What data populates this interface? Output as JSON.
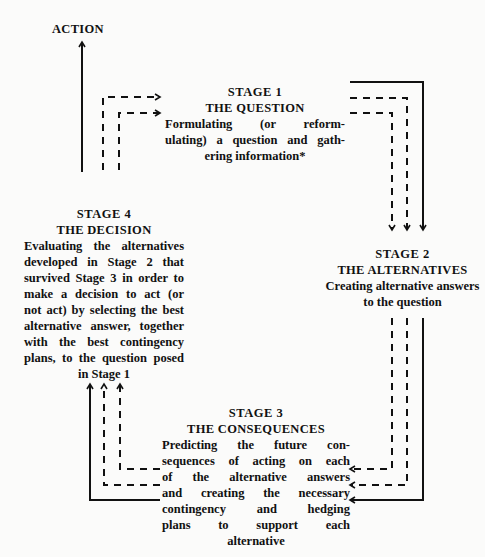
{
  "action_label": "ACTION",
  "stages": [
    {
      "stage": "STAGE 1",
      "title": "THE QUESTION",
      "description": "Formulating (or reformulating) a question and gathering information*",
      "lines": [
        "Formulating (or reform-",
        "ulating) a question and gath-",
        "ering information*"
      ]
    },
    {
      "stage": "STAGE 2",
      "title": "THE ALTERNATIVES",
      "description": "Creating alternative answers to the question",
      "lines": [
        "Creating alternative answers",
        "to the question"
      ]
    },
    {
      "stage": "STAGE 3",
      "title": "THE CONSEQUENCES",
      "description": "Predicting the future consequences of acting on each of the alternative answers and creating the necessary contingency and hedging plans to support each alternative",
      "lines": [
        "Predicting the future con-",
        "sequences of acting on each",
        "of the alternative answers",
        "and creating the necessary",
        "contingency and hedging",
        "plans to support each",
        "alternative"
      ]
    },
    {
      "stage": "STAGE 4",
      "title": "THE DECISION",
      "description": "Evaluating the alternatives developed in Stage 2 that survived Stage 3 in order to make a decision to act (or not act) by selecting the best alternative answer, together with the best contingency plans, to the question posed in Stage 1",
      "lines": [
        "Evaluating the alternatives",
        "developed in Stage 2 that",
        "survived Stage 3 in order to",
        "make a decision to act (or",
        "not act) by selecting the best",
        "alternative answer, together",
        "with the best contingency",
        "plans, to the question posed",
        "in Stage 1"
      ]
    }
  ],
  "flow": {
    "solid": "main cycle path",
    "dashed": "feedback/iteration paths"
  }
}
